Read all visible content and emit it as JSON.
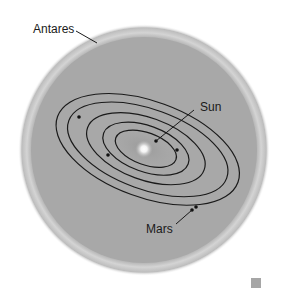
{
  "diagram": {
    "title": "",
    "labels": {
      "antares": "Antares",
      "sun": "Sun",
      "mars": "Mars"
    },
    "colors": {
      "disk": "#a8a8a8",
      "disk_rim": "#cfcfcf",
      "orbit": "#1a1a1a",
      "sun_glow": "#ffffff",
      "background": "#ffffff",
      "corner_square": "#a6a6a6"
    },
    "orbit_count": 5
  }
}
